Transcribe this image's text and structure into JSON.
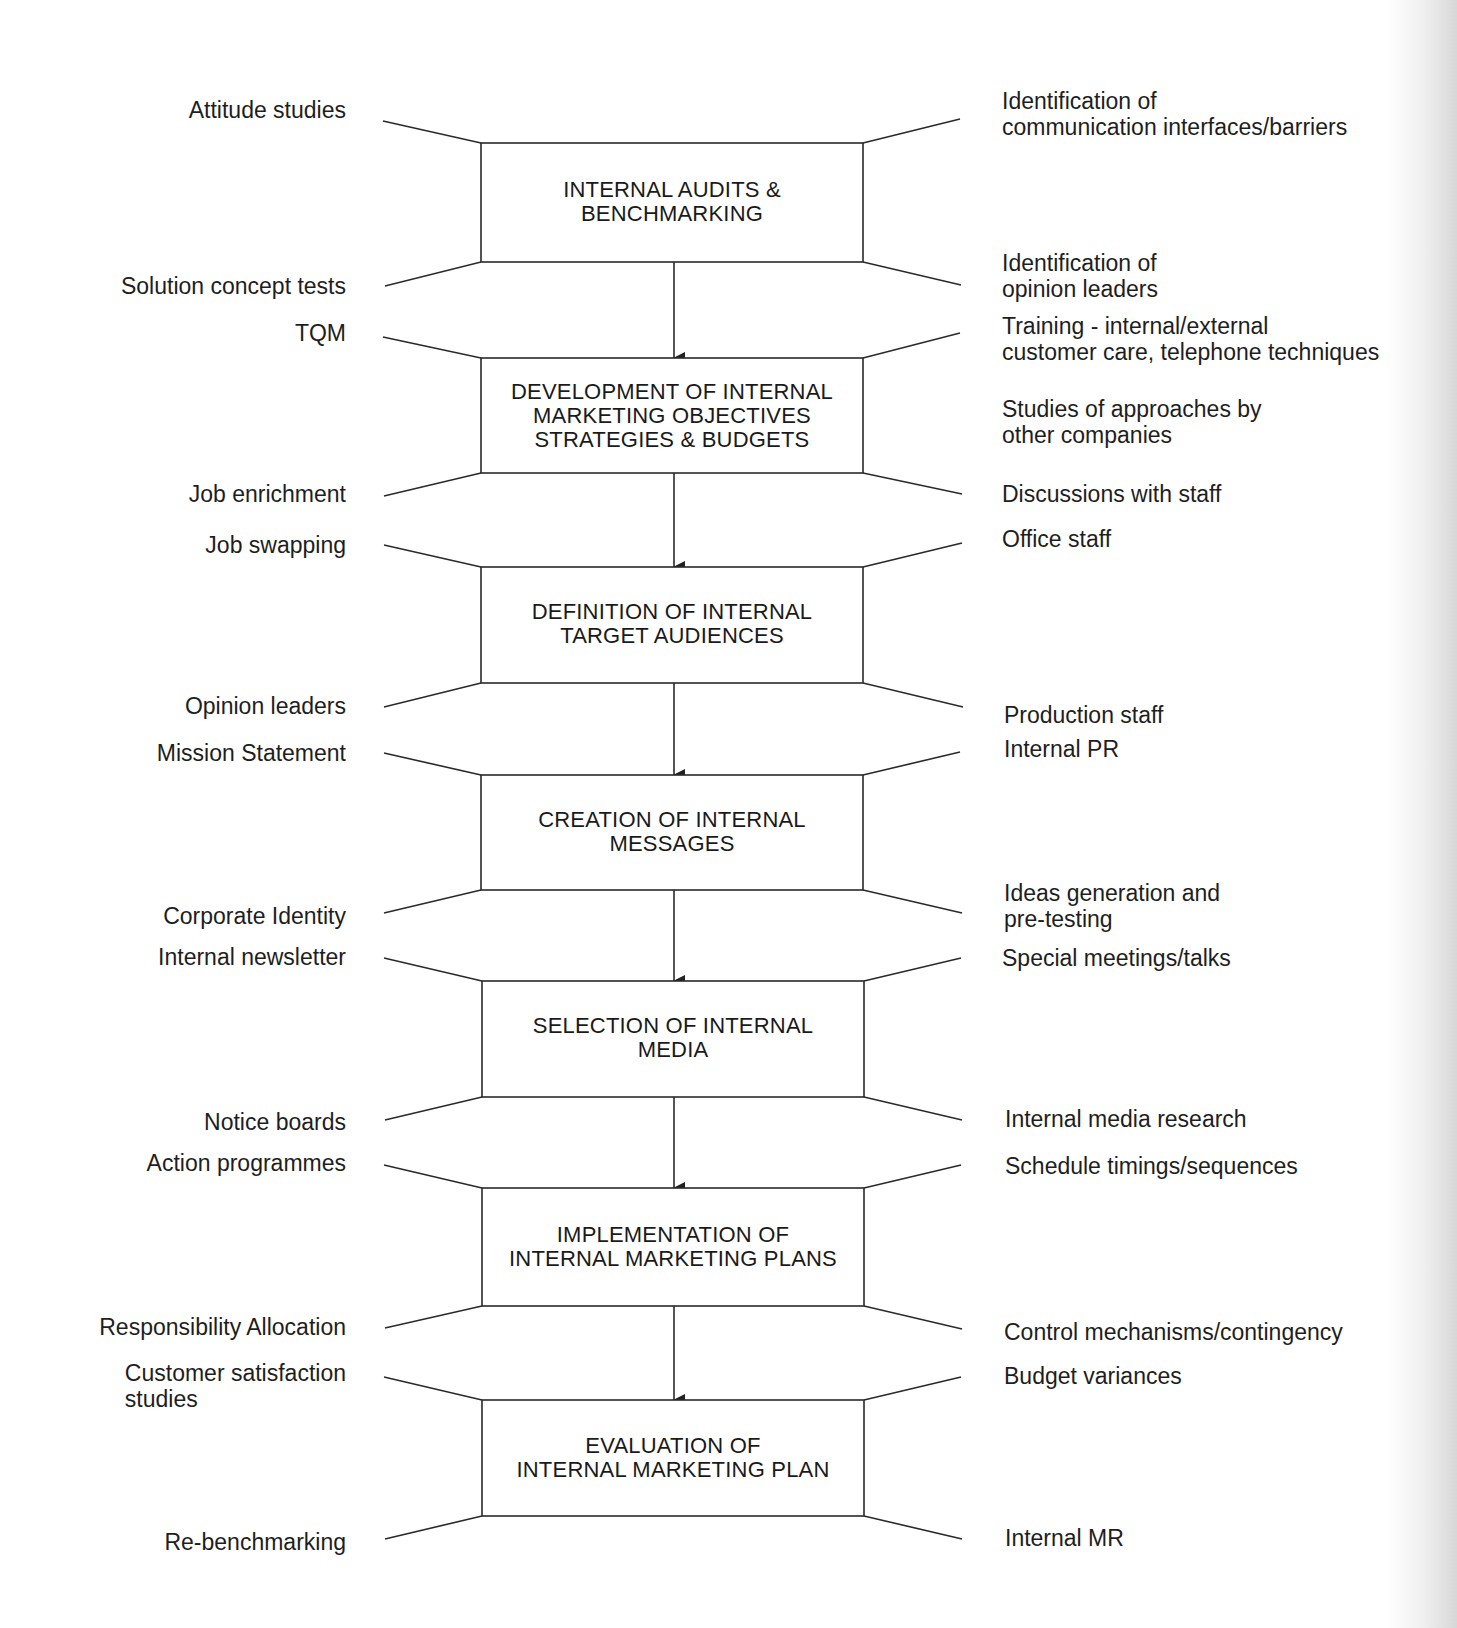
{
  "diagram": {
    "type": "flowchart",
    "stroke_color": "#2a2a2a",
    "stages": [
      {
        "label": "INTERNAL AUDITS &\nBENCHMARKING"
      },
      {
        "label": "DEVELOPMENT OF INTERNAL\nMARKETING OBJECTIVES\nSTRATEGIES & BUDGETS"
      },
      {
        "label": "DEFINITION OF INTERNAL\nTARGET AUDIENCES"
      },
      {
        "label": "CREATION OF INTERNAL\nMESSAGES"
      },
      {
        "label": "SELECTION OF INTERNAL\nMEDIA"
      },
      {
        "label": "IMPLEMENTATION OF\nINTERNAL MARKETING PLANS"
      },
      {
        "label": "EVALUATION OF\nINTERNAL MARKETING PLAN"
      }
    ],
    "left_labels": [
      "Attitude studies",
      "Solution concept tests",
      "TQM",
      "Job enrichment",
      "Job swapping",
      "Opinion leaders",
      "Mission Statement",
      "Corporate Identity",
      "Internal newsletter",
      "Notice boards",
      "Action programmes",
      "Responsibility Allocation",
      "Customer satisfaction\nstudies",
      "Re-benchmarking"
    ],
    "right_labels": [
      "Identification of\ncommunication interfaces/barriers",
      "Identification of\nopinion leaders",
      "Training - internal/external\ncustomer care, telephone techniques",
      "Studies of approaches by\nother companies",
      "Discussions with staff",
      "Office staff",
      "Production staff",
      "Internal PR",
      "Ideas generation and\npre-testing",
      "Special meetings/talks",
      "Internal media research",
      "Schedule timings/sequences",
      "Control mechanisms/contingency",
      "Budget variances",
      "Internal MR"
    ]
  }
}
